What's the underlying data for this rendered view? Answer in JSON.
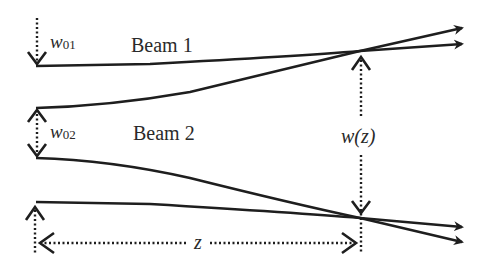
{
  "diagram": {
    "beam1": {
      "label": "Beam 1",
      "waist_label_main": "w",
      "waist_label_sub": "01"
    },
    "beam2": {
      "label": "Beam 2",
      "waist_label_main": "w",
      "waist_label_sub": "02"
    },
    "width_label": "w(z)",
    "distance_label": "z",
    "colors": {
      "line": "#1e1e1e",
      "background": "#ffffff"
    }
  }
}
